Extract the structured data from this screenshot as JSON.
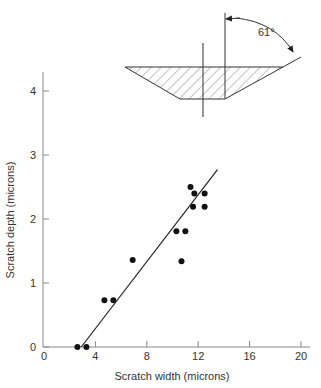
{
  "chart_data": {
    "type": "scatter",
    "title": "",
    "xlabel": "Scratch width (microns)",
    "ylabel": "Scratch depth (microns)",
    "xlim": [
      0,
      20
    ],
    "ylim": [
      0,
      4.3
    ],
    "xticks": [
      0,
      4,
      8,
      12,
      16,
      20
    ],
    "yticks": [
      0,
      1,
      2,
      3,
      4
    ],
    "grid": false,
    "legend": null,
    "series": [
      {
        "name": "measurements",
        "kind": "points",
        "x": [
          2.6,
          3.3,
          4.7,
          5.4,
          6.9,
          10.7,
          10.3,
          11.0,
          11.4,
          11.7,
          12.5,
          11.6,
          12.5
        ],
        "y": [
          0.0,
          0.0,
          0.73,
          0.73,
          1.36,
          1.34,
          1.81,
          1.81,
          2.5,
          2.4,
          2.4,
          2.19,
          2.19
        ]
      },
      {
        "name": "fit line",
        "kind": "line",
        "x": [
          2.9,
          13.5
        ],
        "y": [
          0.0,
          2.77
        ]
      }
    ],
    "annotations": [
      {
        "type": "inset-diagram",
        "description": "Trapezoidal scratch cross-section (hatched) with side wall angle",
        "label": "61°"
      }
    ]
  },
  "labels": {
    "xlabel": "Scratch width (microns)",
    "ylabel": "Scratch depth (microns)",
    "angle": "61°",
    "xticks": [
      "0",
      "4",
      "8",
      "12",
      "16",
      "20"
    ],
    "yticks": [
      "0",
      "1",
      "2",
      "3",
      "4"
    ]
  }
}
